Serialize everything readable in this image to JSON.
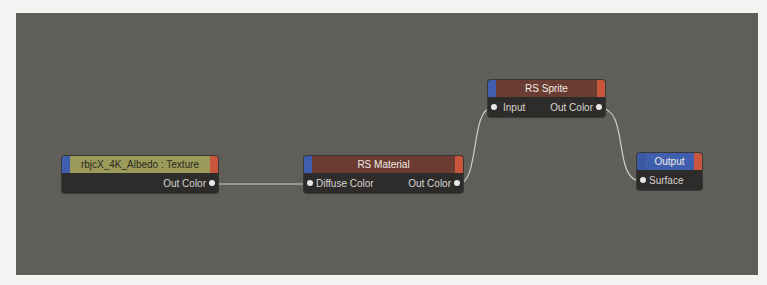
{
  "colors": {
    "canvas": "#5f5e59",
    "node_body": "#2e2c2b",
    "input_cap": "#3f5fae",
    "output_cap": "#c9553c",
    "texture_header": "#9c9a5a",
    "material_header": "#6b3d32",
    "output_header": "#3f5fae",
    "wire": "#cfcfcf"
  },
  "nodes": {
    "texture": {
      "title": "rbjcX_4K_Albedo : Texture",
      "outputs": [
        "Out Color"
      ]
    },
    "material": {
      "title": "RS Material",
      "inputs": [
        "Diffuse Color"
      ],
      "outputs": [
        "Out Color"
      ]
    },
    "sprite": {
      "title": "RS Sprite",
      "inputs": [
        "Input"
      ],
      "outputs": [
        "Out Color"
      ]
    },
    "output": {
      "title": "Output",
      "inputs": [
        "Surface"
      ]
    }
  },
  "connections": [
    {
      "from": "texture.Out Color",
      "to": "material.Diffuse Color"
    },
    {
      "from": "material.Out Color",
      "to": "sprite.Input"
    },
    {
      "from": "sprite.Out Color",
      "to": "output.Surface"
    }
  ]
}
